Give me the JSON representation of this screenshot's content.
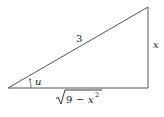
{
  "diagram": {
    "type": "right-triangle",
    "labels": {
      "hypotenuse": "3",
      "opposite": "x",
      "angle": "u",
      "adjacent_radicand_num": "9",
      "adjacent_minus": "−",
      "adjacent_var": "x",
      "adjacent_exp": "2"
    },
    "colors": {
      "stroke": "#555555",
      "text": "#222222"
    }
  }
}
